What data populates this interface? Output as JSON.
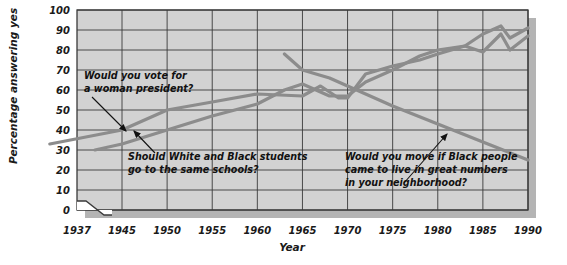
{
  "chart_data": {
    "type": "line",
    "title": "",
    "xlabel": "Year",
    "ylabel": "Percentage answering yes",
    "xlim": [
      1937,
      1990
    ],
    "ylim": [
      0,
      100
    ],
    "grid": true,
    "legend_position": "none",
    "axis_break": "between 1937 and 1945 on the x-axis",
    "xticks": [
      "1937",
      "1945",
      "1950",
      "1955",
      "1960",
      "1965",
      "1970",
      "1975",
      "1980",
      "1985",
      "1990"
    ],
    "yticks": [
      "0",
      "10",
      "20",
      "30",
      "40",
      "50",
      "60",
      "70",
      "80",
      "90",
      "100"
    ],
    "series": [
      {
        "name": "Would you vote for a woman president?",
        "color": "#8c8c8c",
        "x": [
          1937,
          1945,
          1950,
          1955,
          1960,
          1965,
          1967,
          1969,
          1970,
          1972,
          1975,
          1978,
          1980,
          1983,
          1985,
          1987,
          1988,
          1990
        ],
        "values": [
          33,
          40,
          50,
          54,
          58,
          57,
          62,
          56,
          56,
          68,
          72,
          75,
          78,
          82,
          88,
          92,
          86,
          91
        ]
      },
      {
        "name": "Should White and Black students go to the same schools?",
        "color": "#8c8c8c",
        "x": [
          1942,
          1945,
          1950,
          1955,
          1960,
          1963,
          1965,
          1968,
          1970,
          1972,
          1975,
          1978,
          1980,
          1983,
          1985,
          1987,
          1988,
          1990
        ],
        "values": [
          30,
          33,
          40,
          47,
          53,
          60,
          63,
          57,
          57,
          64,
          70,
          77,
          80,
          82,
          79,
          88,
          80,
          87
        ]
      },
      {
        "name": "Would you move if Black people came to live in great numbers in your neighborhood?",
        "color": "#8c8c8c",
        "x": [
          1963,
          1965,
          1968,
          1970,
          1975,
          1980,
          1985,
          1990
        ],
        "values": [
          78,
          70,
          66,
          62,
          52,
          43,
          34,
          25
        ]
      }
    ],
    "annotations": [
      {
        "id": "woman-president",
        "lines": [
          "Would you vote for",
          "a woman president?"
        ],
        "target": "line rising from 33% in 1937"
      },
      {
        "id": "same-schools",
        "lines": [
          "Should White and Black students",
          "go to the same schools?"
        ],
        "target": "line rising from 30% in 1942"
      },
      {
        "id": "would-you-move",
        "lines": [
          "Would you move if Black people",
          "came to live in great numbers",
          "in your neighborhood?"
        ],
        "target": "line declining from 78% in 1963"
      }
    ],
    "colors": {
      "plot_background": "#d2d2d2",
      "grid": "#3a3a3a",
      "line": "#8c8c8c",
      "shadow": "#b4b4b4",
      "text": "#111111"
    }
  }
}
